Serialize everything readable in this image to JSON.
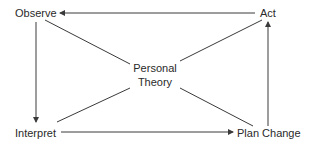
{
  "diagram": {
    "nodes": {
      "observe": "Observe",
      "act": "Act",
      "interpret": "Interpret",
      "plan_change": "Plan Change",
      "center_line1": "Personal",
      "center_line2": "Theory"
    },
    "edges": [
      {
        "from": "Act",
        "to": "Observe",
        "type": "arrow"
      },
      {
        "from": "Observe",
        "to": "Interpret",
        "type": "arrow"
      },
      {
        "from": "Interpret",
        "to": "Plan Change",
        "type": "arrow"
      },
      {
        "from": "Plan Change",
        "to": "Act",
        "type": "arrow"
      },
      {
        "from": "Personal Theory",
        "to": "Observe",
        "type": "line"
      },
      {
        "from": "Personal Theory",
        "to": "Act",
        "type": "line"
      },
      {
        "from": "Personal Theory",
        "to": "Interpret",
        "type": "line"
      },
      {
        "from": "Personal Theory",
        "to": "Plan Change",
        "type": "line"
      }
    ],
    "colors": {
      "line": "#3a3a3a",
      "text": "#2a2a2a",
      "background": "#ffffff"
    }
  }
}
